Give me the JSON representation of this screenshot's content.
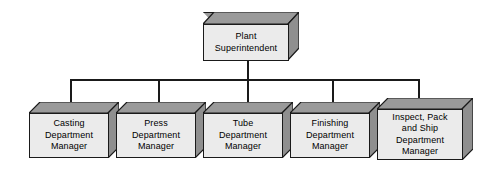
{
  "diagram": {
    "type": "organizational-chart",
    "colors": {
      "box_front": "#ebebeb",
      "box_top": "#9a9a9a",
      "box_side": "#9a9a9a",
      "outline": "#1a1a1a",
      "background": "#ffffff",
      "text": "#000000"
    },
    "root": {
      "id": "plant-superintendent",
      "label": "Plant\nSuperintendent"
    },
    "children": [
      {
        "id": "casting-department-manager",
        "label": "Casting\nDepartment\nManager"
      },
      {
        "id": "press-department-manager",
        "label": "Press\nDepartment\nManager"
      },
      {
        "id": "tube-department-manager",
        "label": "Tube\nDepartment\nManager"
      },
      {
        "id": "finishing-department-manager",
        "label": "Finishing\nDepartment\nManager"
      },
      {
        "id": "inspect-pack-ship-department-manager",
        "label": "Inspect, Pack\nand Ship\nDepartment\nManager"
      }
    ]
  }
}
